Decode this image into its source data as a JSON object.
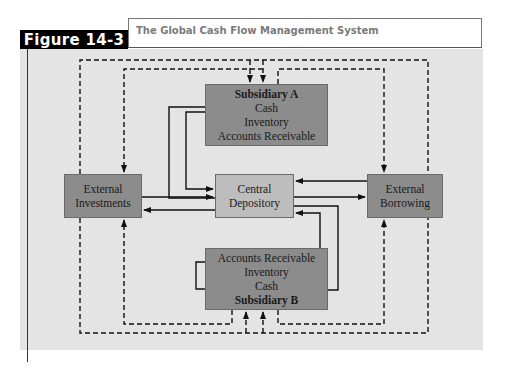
{
  "figure": {
    "label": "Figure 14-3",
    "title": "The Global Cash Flow Management System"
  },
  "nodes": {
    "subsidiary_a": {
      "name": "Subsidiary A",
      "items": [
        "Cash",
        "Inventory",
        "Accounts Receivable"
      ]
    },
    "subsidiary_b": {
      "name": "Subsidiary B",
      "items": [
        "Accounts Receivable",
        "Inventory",
        "Cash"
      ]
    },
    "central": {
      "line1": "Central",
      "line2": "Depository"
    },
    "investments": {
      "line1": "External",
      "line2": "Investments"
    },
    "borrowing": {
      "line1": "External",
      "line2": "Borrowing"
    }
  },
  "legend_colors": {
    "panel": "#e4e4e4",
    "dark_box": "#8c8c8c",
    "light_box": "#bdbdbd",
    "solid_line": "#111111",
    "dashed_line": "#111111"
  },
  "edges": [
    {
      "from": "Central Depository",
      "to": "Subsidiary A",
      "style": "solid"
    },
    {
      "from": "Subsidiary A",
      "to": "Central Depository",
      "style": "solid"
    },
    {
      "from": "Accounts Receivable (A)",
      "to": "Cash (A)",
      "style": "solid"
    },
    {
      "from": "Central Depository",
      "to": "Subsidiary B",
      "style": "solid"
    },
    {
      "from": "Subsidiary B",
      "to": "Central Depository",
      "style": "solid"
    },
    {
      "from": "Accounts Receivable (B)",
      "to": "Cash (B)",
      "style": "solid"
    },
    {
      "from": "External Investments",
      "to": "Central Depository",
      "style": "solid"
    },
    {
      "from": "Central Depository",
      "to": "External Investments",
      "style": "solid"
    },
    {
      "from": "External Borrowing",
      "to": "Central Depository",
      "style": "solid"
    },
    {
      "from": "Central Depository",
      "to": "External Borrowing",
      "style": "solid"
    },
    {
      "from": "External Investments",
      "to": "Subsidiary A",
      "style": "dashed"
    },
    {
      "from": "Subsidiary A",
      "to": "External Investments",
      "style": "dashed"
    },
    {
      "from": "External Borrowing",
      "to": "Subsidiary A",
      "style": "dashed"
    },
    {
      "from": "Subsidiary A",
      "to": "External Borrowing",
      "style": "dashed"
    },
    {
      "from": "External Investments",
      "to": "Subsidiary B",
      "style": "dashed"
    },
    {
      "from": "Subsidiary B",
      "to": "External Investments",
      "style": "dashed"
    },
    {
      "from": "External Borrowing",
      "to": "Subsidiary B",
      "style": "dashed"
    },
    {
      "from": "Subsidiary B",
      "to": "External Borrowing",
      "style": "dashed"
    }
  ]
}
